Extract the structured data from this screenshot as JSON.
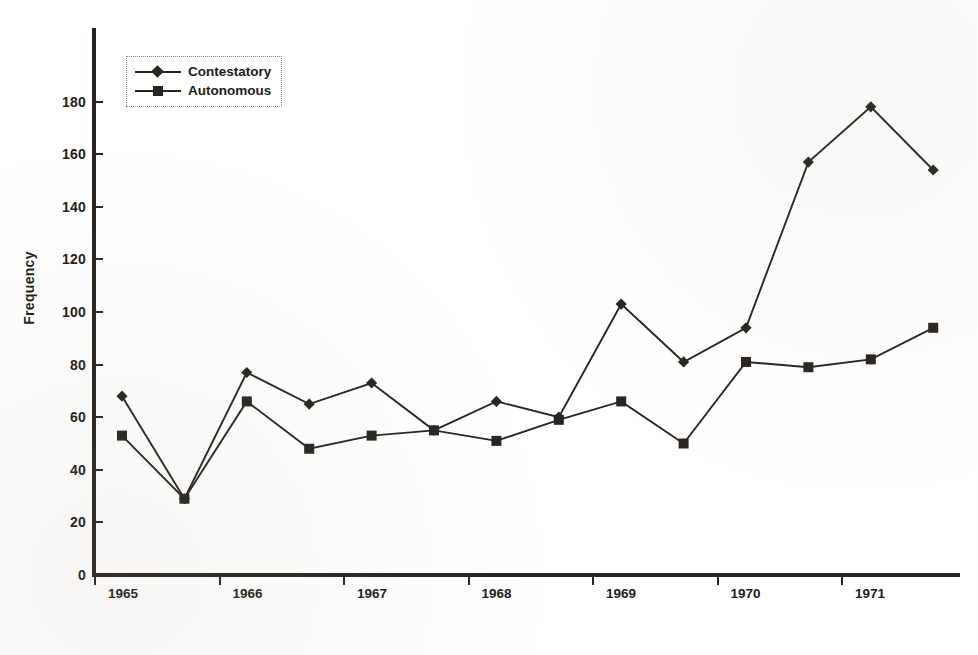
{
  "chart_data": {
    "type": "line",
    "title": "",
    "xlabel": "",
    "ylabel": "Frequency",
    "ylim": [
      0,
      190
    ],
    "yticks": [
      0,
      20,
      40,
      60,
      80,
      100,
      120,
      140,
      160,
      180
    ],
    "grid": false,
    "legend_position": "top-left",
    "x_tick_labels": [
      "1965",
      "1966",
      "1967",
      "1968",
      "1969",
      "1970",
      "1971"
    ],
    "x_points": 14,
    "x": [
      "1965a",
      "1965b",
      "1966a",
      "1966b",
      "1967a",
      "1967b",
      "1968a",
      "1968b",
      "1969a",
      "1969b",
      "1970a",
      "1970b",
      "1971a",
      "1971b"
    ],
    "series": [
      {
        "name": "Contestatory",
        "marker": "diamond",
        "color": "#2a241f",
        "values": [
          68,
          29,
          77,
          65,
          73,
          55,
          66,
          60,
          103,
          81,
          94,
          157,
          178,
          154
        ]
      },
      {
        "name": "Autonomous",
        "marker": "square",
        "color": "#2a241f",
        "values": [
          53,
          29,
          66,
          48,
          53,
          55,
          51,
          59,
          66,
          50,
          81,
          79,
          82,
          94
        ]
      }
    ]
  },
  "axis": {
    "y_title": "Frequency",
    "y_tick_labels": [
      "0",
      "20",
      "40",
      "60",
      "80",
      "100",
      "120",
      "140",
      "160",
      "180"
    ],
    "x_tick_labels": [
      "1965",
      "1966",
      "1967",
      "1968",
      "1969",
      "1970",
      "1971"
    ]
  },
  "legend": {
    "items": [
      {
        "label": "Contestatory",
        "marker": "diamond"
      },
      {
        "label": "Autonomous",
        "marker": "square"
      }
    ]
  },
  "colors": {
    "ink": "#2a241f",
    "paper": "#ffffff",
    "legend_border": "#8a8178"
  }
}
